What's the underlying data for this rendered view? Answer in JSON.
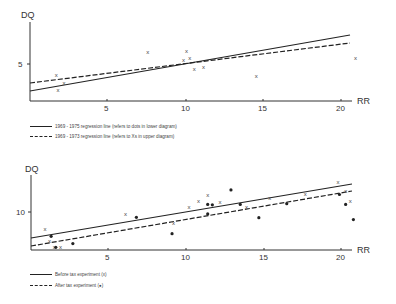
{
  "chart_data": [
    {
      "type": "scatter",
      "title": "",
      "xlabel": "RR",
      "ylabel": "DQ",
      "xticks": [
        5,
        10,
        15,
        20
      ],
      "yticks": [
        5
      ],
      "xlim": [
        0,
        21
      ],
      "ylim": [
        0,
        10.5
      ],
      "grid": false,
      "series": [
        {
          "name": "Xs (1969 - 1973)",
          "marker": "x",
          "points": [
            [
              1.7,
              3.5
            ],
            [
              1.8,
              1.5
            ],
            [
              2.2,
              2.4
            ],
            [
              7.6,
              6.6
            ],
            [
              10.1,
              6.8
            ],
            [
              9.9,
              5.5
            ],
            [
              10.3,
              5.8
            ],
            [
              10.6,
              4.3
            ],
            [
              11.2,
              4.6
            ],
            [
              14.6,
              3.4
            ],
            [
              21.0,
              5.8
            ]
          ]
        }
      ],
      "lines": [
        {
          "name": "1969 - 1975 regression line",
          "style": "solid",
          "from": [
            0,
            1.4
          ],
          "to": [
            20.6,
            8.9
          ]
        },
        {
          "name": "1969 - 1973 regression line",
          "style": "dashed",
          "from": [
            0,
            2.4
          ],
          "to": [
            20.6,
            7.8
          ]
        }
      ],
      "legend": [
        {
          "style": "solid",
          "label": "1969 - 1975 regression line   (refers to dots in lower diagram)"
        },
        {
          "style": "dashed",
          "label": "1969 - 1973 regression line  (refers to Xs in upper diagram)"
        }
      ]
    },
    {
      "type": "scatter",
      "title": "",
      "xlabel": "RR",
      "ylabel": "DQ",
      "xticks": [
        5,
        10,
        15,
        20
      ],
      "yticks": [
        10
      ],
      "xlim": [
        0,
        21
      ],
      "ylim": [
        0,
        21
      ],
      "grid": false,
      "series": [
        {
          "name": "Before tax experiment (x)",
          "marker": "x",
          "points": [
            [
              0.9,
              5.5
            ],
            [
              1.2,
              2.3
            ],
            [
              1.5,
              0.9
            ],
            [
              1.9,
              0.9
            ],
            [
              6.1,
              9.4
            ],
            [
              9.2,
              7.0
            ],
            [
              10.2,
              11.4
            ],
            [
              10.8,
              13.0
            ],
            [
              11.4,
              14.6
            ],
            [
              12.2,
              12.6
            ],
            [
              13.9,
              11.4
            ],
            [
              15.4,
              13.7
            ],
            [
              17.7,
              14.8
            ],
            [
              19.8,
              17.9
            ],
            [
              20.3,
              15.4
            ],
            [
              20.6,
              12.9
            ]
          ]
        },
        {
          "name": "After tax experiment (●)",
          "marker": "dot",
          "points": [
            [
              1.3,
              3.6
            ],
            [
              1.6,
              0.7
            ],
            [
              2.7,
              1.7
            ],
            [
              6.8,
              8.6
            ],
            [
              9.1,
              4.3
            ],
            [
              11.4,
              12.0
            ],
            [
              11.7,
              11.9
            ],
            [
              11.4,
              9.5
            ],
            [
              13.5,
              12.0
            ],
            [
              12.9,
              15.8
            ],
            [
              14.7,
              8.5
            ],
            [
              16.5,
              12.2
            ],
            [
              19.9,
              14.6
            ],
            [
              20.3,
              12.0
            ],
            [
              20.8,
              8.0
            ]
          ]
        }
      ],
      "lines": [
        {
          "name": "Before tax experiment",
          "style": "solid",
          "from": [
            0,
            3.3
          ],
          "to": [
            20.7,
            14.5
          ]
        },
        {
          "name": "After tax experiment",
          "style": "dashed",
          "from": [
            0,
            1.1
          ],
          "to": [
            20.7,
            12.6
          ]
        }
      ],
      "legend": [
        {
          "style": "solid",
          "label": "Before tax experiment  (x)"
        },
        {
          "style": "dashed",
          "label": "After tax experiment  (●)"
        }
      ]
    }
  ],
  "upper": {
    "ylabel": "DQ",
    "xlabel": "RR",
    "ytick": "5",
    "xticks": [
      "5",
      "10",
      "15",
      "20"
    ],
    "legend_solid": "1969 - 1975 regression line   (refers to dots in lower diagram)",
    "legend_dashed": "1969 - 1973 regression line  (refers to Xs in upper diagram)"
  },
  "lower": {
    "ylabel": "DQ",
    "xlabel": "RR",
    "ytick": "10",
    "xticks": [
      "5",
      "10",
      "15",
      "20"
    ],
    "legend_solid": "Before tax experiment  (x)",
    "legend_dashed": "After tax experiment  (●)"
  }
}
